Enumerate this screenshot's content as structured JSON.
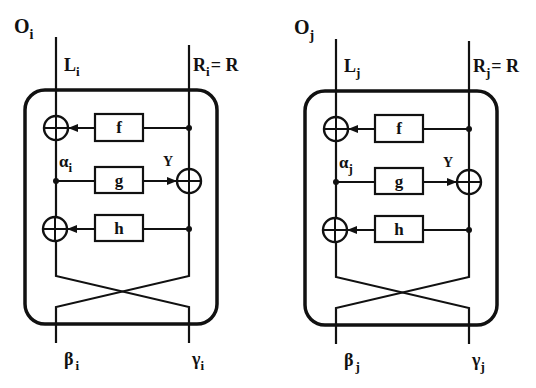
{
  "diagram": {
    "type": "two-block-network-diagram",
    "blocks": [
      {
        "id": "i",
        "name_main": "O",
        "name_sub": "i",
        "input_left_main": "L",
        "input_left_sub": "i",
        "input_right_main": "R",
        "input_right_sub": "i",
        "input_right_eq": "= R",
        "alpha_main": "α",
        "alpha_sub": "i",
        "y_label": "Y",
        "functions": [
          "f",
          "g",
          "h"
        ],
        "output_left_main": "β",
        "output_left_sub": "i",
        "output_right_main": "γ",
        "output_right_sub": "i"
      },
      {
        "id": "j",
        "name_main": "O",
        "name_sub": "j",
        "input_left_main": "L",
        "input_left_sub": "j",
        "input_right_main": "R",
        "input_right_sub": "j",
        "input_right_eq": "= R",
        "alpha_main": "α",
        "alpha_sub": "j",
        "y_label": "Y",
        "functions": [
          "f",
          "g",
          "h"
        ],
        "output_left_main": "β",
        "output_left_sub": "j",
        "output_right_main": "γ",
        "output_right_sub": "j"
      }
    ],
    "colors": {
      "stroke": "#111111",
      "background": "#ffffff"
    }
  }
}
